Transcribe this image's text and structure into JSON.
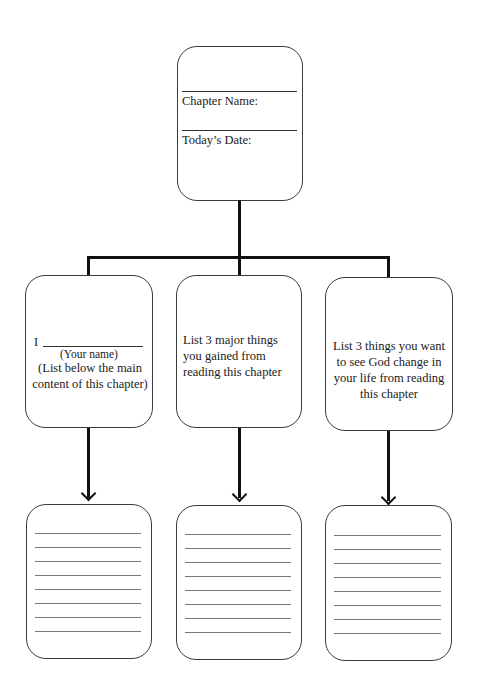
{
  "top_box": {
    "chapter_label": "Chapter Name:",
    "date_label": "Today’s Date:"
  },
  "middle_boxes": [
    {
      "prefix": "I",
      "name_hint": "(Your name)",
      "instruction": "(List below the main content of this chapter)"
    },
    {
      "instruction": "List 3 major things you gained from reading this chapter"
    },
    {
      "instruction": "List 3 things you want to see God change in your life from reading this chapter"
    }
  ],
  "bottom_boxes": [
    {
      "lines": 8
    },
    {
      "lines": 8
    },
    {
      "lines": 8
    }
  ]
}
